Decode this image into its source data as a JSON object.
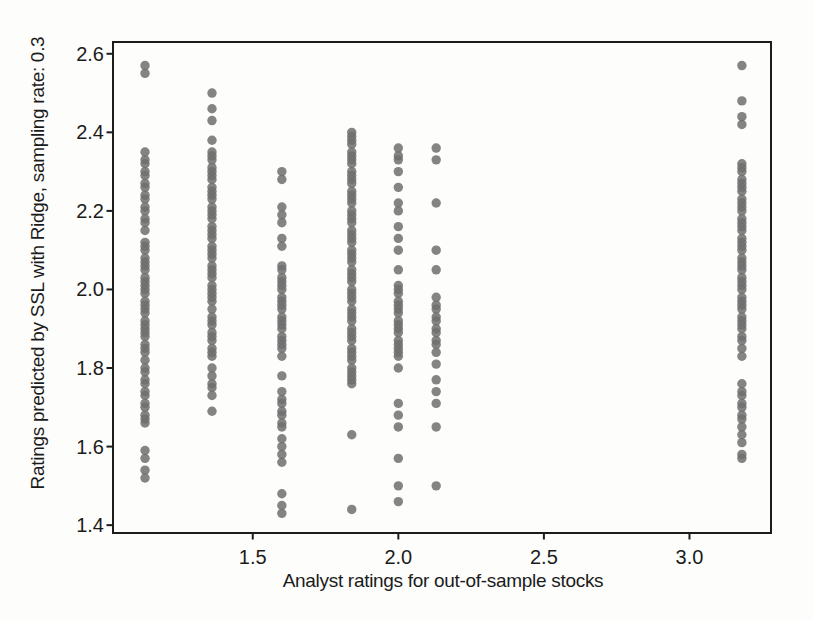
{
  "chart_data": {
    "type": "scatter",
    "xlabel": "Analyst ratings for out-of-sample stocks",
    "ylabel": "Ratings predicted by SSL with Ridge, sampling rate: 0.3",
    "x_ticks": [
      "1.5",
      "2.0",
      "2.5",
      "3.0"
    ],
    "y_ticks": [
      "1.4",
      "1.6",
      "1.8",
      "2.0",
      "2.2",
      "2.4",
      "2.6"
    ],
    "xlim": [
      1.02,
      3.28
    ],
    "ylim": [
      1.38,
      2.63
    ],
    "grid": false,
    "legend": false,
    "axis_color": "#1c1c1c",
    "text_color": "#1b1b1b",
    "background": "#fdfdfc",
    "marker": {
      "shape": "circle",
      "color": "#6f6f6f",
      "opacity": 0.85,
      "radius_px": 4.7
    },
    "series": [
      {
        "name": "analyst-rating-1.13",
        "x": 1.13,
        "y": [
          2.57,
          2.55,
          2.35,
          2.33,
          2.32,
          2.3,
          2.29,
          2.27,
          2.26,
          2.24,
          2.23,
          2.21,
          2.2,
          2.18,
          2.17,
          2.15,
          2.12,
          2.11,
          2.1,
          2.08,
          2.07,
          2.06,
          2.05,
          2.03,
          2.02,
          2.01,
          2.0,
          1.99,
          1.97,
          1.96,
          1.95,
          1.94,
          1.92,
          1.91,
          1.9,
          1.89,
          1.88,
          1.86,
          1.85,
          1.84,
          1.82,
          1.8,
          1.79,
          1.77,
          1.76,
          1.74,
          1.73,
          1.71,
          1.7,
          1.68,
          1.67,
          1.66,
          1.59,
          1.57,
          1.54,
          1.52
        ]
      },
      {
        "name": "analyst-rating-1.36",
        "x": 1.36,
        "y": [
          2.5,
          2.46,
          2.43,
          2.38,
          2.35,
          2.34,
          2.33,
          2.31,
          2.3,
          2.29,
          2.28,
          2.26,
          2.25,
          2.24,
          2.23,
          2.21,
          2.2,
          2.19,
          2.18,
          2.16,
          2.15,
          2.14,
          2.13,
          2.11,
          2.1,
          2.09,
          2.08,
          2.06,
          2.05,
          2.04,
          2.03,
          2.01,
          2.0,
          1.99,
          1.98,
          1.97,
          1.95,
          1.93,
          1.92,
          1.91,
          1.89,
          1.88,
          1.87,
          1.85,
          1.84,
          1.83,
          1.8,
          1.78,
          1.76,
          1.75,
          1.73,
          1.69
        ]
      },
      {
        "name": "analyst-rating-1.60",
        "x": 1.6,
        "y": [
          2.3,
          2.28,
          2.21,
          2.19,
          2.17,
          2.13,
          2.11,
          2.06,
          2.05,
          2.03,
          2.02,
          2.01,
          2.0,
          1.98,
          1.97,
          1.96,
          1.95,
          1.93,
          1.92,
          1.91,
          1.9,
          1.88,
          1.87,
          1.86,
          1.85,
          1.83,
          1.78,
          1.74,
          1.72,
          1.71,
          1.69,
          1.68,
          1.66,
          1.65,
          1.62,
          1.6,
          1.58,
          1.56,
          1.48,
          1.45,
          1.43
        ]
      },
      {
        "name": "analyst-rating-1.84",
        "x": 1.84,
        "y": [
          2.4,
          2.39,
          2.38,
          2.37,
          2.35,
          2.34,
          2.33,
          2.32,
          2.3,
          2.29,
          2.28,
          2.27,
          2.25,
          2.24,
          2.23,
          2.22,
          2.2,
          2.19,
          2.18,
          2.17,
          2.15,
          2.14,
          2.13,
          2.12,
          2.1,
          2.09,
          2.08,
          2.07,
          2.05,
          2.04,
          2.03,
          2.02,
          2.0,
          1.99,
          1.98,
          1.97,
          1.95,
          1.94,
          1.93,
          1.92,
          1.9,
          1.89,
          1.88,
          1.87,
          1.85,
          1.84,
          1.83,
          1.82,
          1.8,
          1.79,
          1.78,
          1.77,
          1.76,
          1.63,
          1.44
        ]
      },
      {
        "name": "analyst-rating-2.00",
        "x": 2.0,
        "y": [
          2.36,
          2.34,
          2.33,
          2.3,
          2.26,
          2.22,
          2.2,
          2.16,
          2.13,
          2.1,
          2.05,
          2.01,
          2.0,
          1.99,
          1.97,
          1.96,
          1.95,
          1.94,
          1.92,
          1.91,
          1.9,
          1.89,
          1.87,
          1.86,
          1.85,
          1.84,
          1.83,
          1.8,
          1.71,
          1.68,
          1.65,
          1.57,
          1.5,
          1.46
        ]
      },
      {
        "name": "analyst-rating-2.13",
        "x": 2.13,
        "y": [
          2.36,
          2.33,
          2.22,
          2.1,
          2.05,
          1.98,
          1.96,
          1.95,
          1.93,
          1.92,
          1.9,
          1.89,
          1.87,
          1.86,
          1.84,
          1.81,
          1.77,
          1.74,
          1.71,
          1.65,
          1.5
        ]
      },
      {
        "name": "analyst-rating-3.18",
        "x": 3.18,
        "y": [
          2.57,
          2.48,
          2.44,
          2.42,
          2.32,
          2.31,
          2.3,
          2.28,
          2.27,
          2.26,
          2.25,
          2.23,
          2.22,
          2.21,
          2.2,
          2.18,
          2.17,
          2.16,
          2.15,
          2.13,
          2.12,
          2.11,
          2.1,
          2.08,
          2.07,
          2.06,
          2.05,
          2.03,
          2.02,
          2.01,
          2.0,
          1.98,
          1.97,
          1.96,
          1.95,
          1.93,
          1.92,
          1.91,
          1.9,
          1.88,
          1.87,
          1.85,
          1.83,
          1.76,
          1.74,
          1.73,
          1.71,
          1.7,
          1.68,
          1.67,
          1.65,
          1.63,
          1.61,
          1.58,
          1.57
        ]
      }
    ]
  }
}
